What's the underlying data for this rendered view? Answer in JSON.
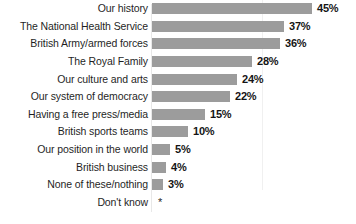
{
  "chart_data": {
    "type": "bar",
    "orientation": "horizontal",
    "title": "",
    "subtitle": "",
    "xlabel": "",
    "ylabel": "",
    "xlim": [
      0,
      45
    ],
    "grid": false,
    "legend": null,
    "value_suffix": "%",
    "categories": [
      "Our history",
      "The National Health Service",
      "British Army/armed forces",
      "The Royal Family",
      "Our culture and arts",
      "Our system of democracy",
      "Having a free press/media",
      "British sports teams",
      "Our position in the world",
      "British business",
      "None of these/nothing",
      "Don't know"
    ],
    "values": [
      45,
      37,
      36,
      28,
      24,
      22,
      15,
      10,
      5,
      4,
      3,
      null
    ],
    "value_labels": [
      "45%",
      "37%",
      "36%",
      "28%",
      "24%",
      "22%",
      "15%",
      "10%",
      "5%",
      "4%",
      "3%",
      "*"
    ],
    "annotations": [
      {
        "category": "Don't know",
        "text": "*",
        "note": "no bar drawn; value below rounding threshold"
      }
    ]
  },
  "style": {
    "bar_color": "#9c9c9c",
    "background_color": "#ffffff",
    "label_color": "#1f1f1f",
    "value_color": "#151515"
  }
}
